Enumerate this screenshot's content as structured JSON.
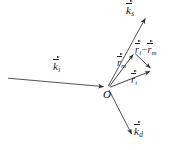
{
  "figure": {
    "type": "vector-scattering-geometry-diagram",
    "background_color": "#ffffff",
    "stroke_color": "#3a3a3a",
    "text_color": "#1a1a1a",
    "origin": {
      "label": "O",
      "x": 107,
      "y": 88
    },
    "vectors": [
      {
        "name": "k-incident",
        "symbol": "k",
        "subscript": "i",
        "accent": "vector-arrow",
        "from": {
          "x": 8,
          "y": 78
        },
        "to": {
          "x": 106,
          "y": 87
        },
        "label": {
          "x": 57,
          "y": 62
        }
      },
      {
        "name": "k-scattered",
        "symbol": "k",
        "subscript": "s",
        "accent": "vector-arrow",
        "from": {
          "x": 108,
          "y": 86
        },
        "to": {
          "x": 147,
          "y": 16
        },
        "label": {
          "x": 127,
          "y": 5
        }
      },
      {
        "name": "k-diffracted",
        "symbol": "k",
        "subscript": "d",
        "accent": "vector-arrow",
        "from": {
          "x": 109,
          "y": 90
        },
        "to": {
          "x": 133,
          "y": 137
        },
        "label": {
          "x": 134,
          "y": 127
        }
      },
      {
        "name": "r-m",
        "symbol": "r",
        "subscript": "m",
        "accent": "vector-arrow",
        "from": {
          "x": 109,
          "y": 87
        },
        "to": {
          "x": 134,
          "y": 52
        },
        "label": {
          "x": 120,
          "y": 59
        }
      },
      {
        "name": "r-i",
        "symbol": "r",
        "subscript": "i",
        "accent": "vector-arrow",
        "from": {
          "x": 110,
          "y": 87
        },
        "to": {
          "x": 153,
          "y": 70
        },
        "label": {
          "x": 133,
          "y": 76
        }
      },
      {
        "name": "r-i-minus-r-m",
        "symbol": "r",
        "subscript": "i",
        "operator": "−",
        "symbol2": "r",
        "subscript2": "m",
        "accent": "vector-arrow",
        "from": {
          "x": 135,
          "y": 53
        },
        "to": {
          "x": 152,
          "y": 69
        },
        "label": {
          "x": 137,
          "y": 46
        }
      }
    ],
    "labels": {
      "k_incident": "k",
      "k_incident_sub": "i",
      "k_scattered": "k",
      "k_scattered_sub": "s",
      "k_diffracted": "k",
      "k_diffracted_sub": "d",
      "r_m": "r",
      "r_m_sub": "m",
      "r_i": "r",
      "r_i_sub": "i",
      "diff_first": "r",
      "diff_first_sub": "i",
      "diff_operator": "−",
      "diff_second": "r",
      "diff_second_sub": "m",
      "origin": "O"
    }
  }
}
